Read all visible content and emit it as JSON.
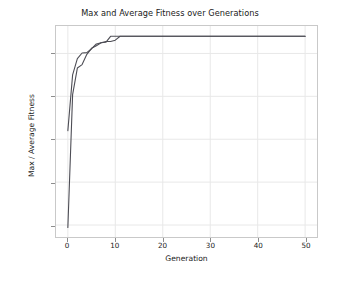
{
  "chart_data": {
    "type": "line",
    "title": "Max and Average Fitness over Generations",
    "xlabel": "Generation",
    "ylabel": "Max / Average Fitness",
    "xlim": [
      -2.5,
      52.5
    ],
    "ylim": [
      48.6,
      73.2
    ],
    "xticks": [
      0,
      10,
      20,
      30,
      40,
      50
    ],
    "yticks": [
      50,
      55,
      60,
      65,
      70
    ],
    "grid": true,
    "legend": "none",
    "line_color": "#4d4d55",
    "background": "#ffffff",
    "grid_color": "#e8e8e8",
    "x": [
      0,
      1,
      2,
      3,
      4,
      5,
      6,
      7,
      8,
      9,
      10,
      11,
      12,
      13,
      14,
      15,
      16,
      17,
      18,
      19,
      20,
      21,
      22,
      23,
      24,
      25,
      26,
      27,
      28,
      29,
      30,
      31,
      32,
      33,
      34,
      35,
      36,
      37,
      38,
      39,
      40,
      41,
      42,
      43,
      44,
      45,
      46,
      47,
      48,
      49,
      50
    ],
    "series": [
      {
        "name": "Max Fitness",
        "values": [
          61.0,
          67.5,
          69.4,
          70.05,
          70.1,
          70.55,
          71.1,
          71.25,
          71.3,
          72.0,
          72.0,
          72.0,
          72.0,
          72.0,
          72.0,
          72.0,
          72.0,
          72.0,
          72.0,
          72.0,
          72.0,
          72.0,
          72.0,
          72.0,
          72.0,
          72.0,
          72.0,
          72.0,
          72.0,
          72.0,
          72.0,
          72.0,
          72.0,
          72.0,
          72.0,
          72.0,
          72.0,
          72.0,
          72.0,
          72.0,
          72.0,
          72.0,
          72.0,
          72.0,
          72.0,
          72.0,
          72.0,
          72.0,
          72.0,
          72.0,
          72.0
        ]
      },
      {
        "name": "Average Fitness",
        "values": [
          49.7,
          65.2,
          68.3,
          68.7,
          69.9,
          70.6,
          70.9,
          71.25,
          71.4,
          71.4,
          71.55,
          72.0,
          72.0,
          72.0,
          72.0,
          72.0,
          72.0,
          72.0,
          72.0,
          72.0,
          72.0,
          72.0,
          72.0,
          72.0,
          72.0,
          72.0,
          72.0,
          72.0,
          72.0,
          72.0,
          72.0,
          72.0,
          72.0,
          72.0,
          72.0,
          72.0,
          72.0,
          72.0,
          72.0,
          72.0,
          72.0,
          72.0,
          72.0,
          72.0,
          72.0,
          72.0,
          72.0,
          72.0,
          72.0,
          72.0,
          72.0
        ]
      }
    ]
  }
}
